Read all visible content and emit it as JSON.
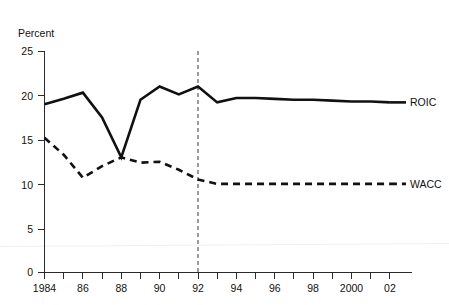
{
  "chart_data": {
    "type": "line",
    "title": "",
    "subtitle": "",
    "xlabel": "",
    "ylabel": "Percent",
    "ylim": [
      0,
      25
    ],
    "xlim": [
      1984,
      2002
    ],
    "grid": false,
    "legend_position": "right-inline",
    "y_ticks": [
      "0",
      "5",
      "10",
      "15",
      "20",
      "25"
    ],
    "y_tick_values": [
      0,
      5,
      10,
      15,
      20,
      25
    ],
    "x_ticks": [
      "1984",
      "86",
      "88",
      "90",
      "92",
      "94",
      "96",
      "98",
      "2000",
      "02"
    ],
    "x_tick_values": [
      1984,
      1986,
      1988,
      1990,
      1992,
      1994,
      1996,
      1998,
      2000,
      2002
    ],
    "x": [
      1984,
      1985,
      1986,
      1987,
      1988,
      1989,
      1990,
      1991,
      1992,
      1993,
      1994,
      1995,
      1996,
      1997,
      1998,
      1999,
      2000,
      2001,
      2002
    ],
    "series": [
      {
        "name": "ROIC",
        "style": "solid",
        "color": "#111111",
        "values": [
          19.0,
          19.6,
          20.3,
          17.5,
          13.0,
          19.5,
          21.0,
          20.1,
          21.0,
          19.2,
          19.7,
          19.7,
          19.6,
          19.5,
          19.5,
          19.4,
          19.3,
          19.3,
          19.2
        ]
      },
      {
        "name": "WACC",
        "style": "dashed",
        "color": "#111111",
        "values": [
          15.2,
          13.3,
          10.7,
          12.0,
          13.0,
          12.4,
          12.5,
          11.6,
          10.5,
          10.0,
          10.0,
          10.0,
          10.0,
          10.0,
          10.0,
          10.0,
          10.0,
          10.0,
          10.0
        ]
      }
    ],
    "annotations": [
      {
        "name": "reference-line",
        "type": "vertical-dashed-line",
        "x_value": 1992
      }
    ]
  },
  "labels": {
    "y_axis_title": "Percent",
    "series_roic": "ROIC",
    "series_wacc": "WACC"
  }
}
